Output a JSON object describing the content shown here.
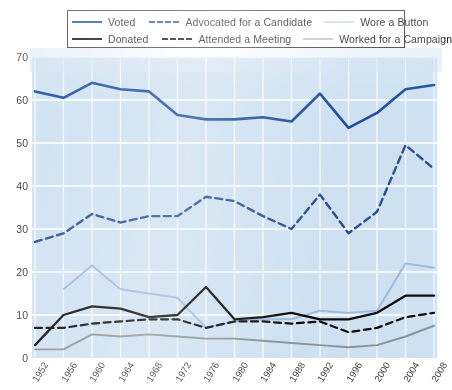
{
  "legend": {
    "rows": [
      [
        {
          "key": "voted",
          "label": "Voted",
          "swatch": "sw-voted",
          "icon": "solid-line-icon"
        },
        {
          "key": "advocated",
          "label": "Advocated for a Candidate",
          "swatch": "sw-advocated",
          "icon": "dashed-line-icon"
        },
        {
          "key": "button",
          "label": "Wore a Button",
          "swatch": "sw-button",
          "icon": "solid-line-icon"
        }
      ],
      [
        {
          "key": "donated",
          "label": "Donated",
          "swatch": "sw-donated",
          "icon": "solid-line-icon"
        },
        {
          "key": "attended",
          "label": "Attended a Meeting",
          "swatch": "sw-attended",
          "icon": "dashed-line-icon"
        },
        {
          "key": "campaign",
          "label": "Worked for a Campaign",
          "swatch": "sw-campaign",
          "icon": "solid-line-icon"
        }
      ]
    ]
  },
  "colors": {
    "plot_background": "#cfe1f1",
    "gridline": "#ffffff",
    "voted": "#1f4e9c",
    "advocated": "#2b4f8e",
    "donated": "#0c0c0c",
    "attended": "#0c0c0c",
    "wore_a_button": "#9fb9dd",
    "worked_for_a_campaign": "#8c9397",
    "legend_border": "#3d3d3d",
    "axis_text": "#3b3b3b"
  },
  "chart_data": {
    "type": "line",
    "title": "",
    "xlabel": "",
    "ylabel": "",
    "xlim": [
      1952,
      2008
    ],
    "ylim": [
      0,
      70
    ],
    "yticks": [
      0,
      10,
      20,
      30,
      40,
      50,
      60,
      70
    ],
    "grid": true,
    "legend_position": "top",
    "categories": [
      "1952",
      "1956",
      "1960",
      "1964",
      "1968",
      "1972",
      "1976",
      "1980",
      "1984",
      "1988",
      "1992",
      "1996",
      "2000",
      "2004",
      "2008"
    ],
    "series": [
      {
        "name": "Voted",
        "color": "#1f4e9c",
        "style": "solid",
        "width": 2.6,
        "values": [
          62,
          60.5,
          64,
          62.5,
          62,
          56.5,
          55.5,
          55.5,
          56,
          55,
          61.5,
          53.5,
          57,
          62.5,
          63.5
        ]
      },
      {
        "name": "Advocated for a Candidate",
        "color": "#2b4f8e",
        "style": "dashed",
        "width": 2.4,
        "values": [
          27,
          29,
          33.5,
          31.5,
          33,
          33,
          37.5,
          36.5,
          33,
          30,
          38,
          29,
          34,
          49.5,
          44
        ]
      },
      {
        "name": "Wore a Button",
        "color": "#9fb9dd",
        "style": "solid",
        "width": 1.9,
        "values": [
          null,
          16,
          21.5,
          16,
          15,
          14,
          7,
          8.5,
          9,
          9,
          11,
          10.5,
          11,
          22,
          21
        ]
      },
      {
        "name": "Donated",
        "color": "#0c0c0c",
        "style": "solid",
        "width": 2.3,
        "values": [
          3,
          10,
          12,
          11.5,
          9.5,
          10,
          16.5,
          9,
          9.5,
          10.5,
          9,
          9,
          10.5,
          14.5,
          14.5
        ]
      },
      {
        "name": "Attended a Meeting",
        "color": "#0c0c0c",
        "style": "dashed",
        "width": 2.2,
        "values": [
          7,
          7,
          8,
          8.5,
          9,
          9,
          7,
          8.5,
          8.5,
          8,
          8.5,
          6,
          7,
          9.5,
          10.5
        ]
      },
      {
        "name": "Worked for a Campaign",
        "color": "#8c9397",
        "style": "solid",
        "width": 1.9,
        "values": [
          2,
          2,
          5.5,
          5,
          5.5,
          5,
          4.5,
          4.5,
          4,
          3.5,
          3,
          2.5,
          3,
          5,
          7.5
        ]
      }
    ]
  }
}
